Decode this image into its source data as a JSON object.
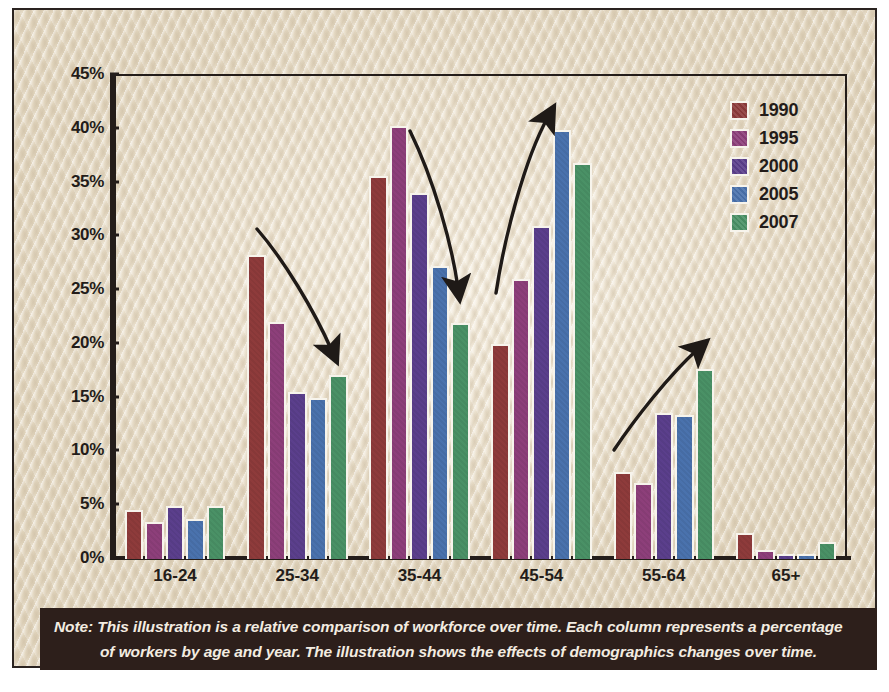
{
  "chart_data": {
    "type": "bar",
    "title": "",
    "xlabel": "",
    "ylabel": "",
    "categories": [
      "16-24",
      "25-34",
      "35-44",
      "45-54",
      "55-64",
      "65+"
    ],
    "ylim": [
      0,
      45
    ],
    "ytick_labels": [
      "0%",
      "5%",
      "10%",
      "15%",
      "20%",
      "25%",
      "30%",
      "35%",
      "40%",
      "45%"
    ],
    "ytick_values": [
      0,
      5,
      10,
      15,
      20,
      25,
      30,
      35,
      40,
      45
    ],
    "grid": false,
    "legend_position": "top-right",
    "value_unit": "%",
    "series": [
      {
        "name": "1990",
        "color": "#8e3b3b",
        "values": [
          4.6,
          28.3,
          35.6,
          20.0,
          8.1,
          2.4
        ]
      },
      {
        "name": "1995",
        "color": "#8d3f7a",
        "values": [
          3.4,
          22.0,
          40.3,
          26.0,
          7.1,
          0.8
        ]
      },
      {
        "name": "2000",
        "color": "#5b3f8c",
        "values": [
          4.9,
          15.5,
          34.0,
          31.0,
          13.6,
          0.5
        ]
      },
      {
        "name": "2005",
        "color": "#4a72ad",
        "values": [
          3.7,
          15.0,
          27.2,
          39.9,
          13.4,
          0.5
        ]
      },
      {
        "name": "2007",
        "color": "#4a9166",
        "values": [
          4.9,
          17.1,
          21.9,
          36.8,
          17.7,
          1.6
        ]
      }
    ],
    "annotations": [
      {
        "name": "trend-arrow-25-34-declining",
        "direction": "down"
      },
      {
        "name": "trend-arrow-35-44-declining",
        "direction": "down"
      },
      {
        "name": "trend-arrow-45-54-rising",
        "direction": "up"
      },
      {
        "name": "trend-arrow-55-64-rising",
        "direction": "up"
      }
    ]
  },
  "legend": {
    "items": [
      {
        "label": "1990",
        "color": "#8e3b3b"
      },
      {
        "label": "1995",
        "color": "#8d3f7a"
      },
      {
        "label": "2000",
        "color": "#5b3f8c"
      },
      {
        "label": "2005",
        "color": "#4a72ad"
      },
      {
        "label": "2007",
        "color": "#4a9166"
      }
    ]
  },
  "note": {
    "line1": "Note: This illustration is a relative comparison of workforce over time.  Each column represents a percentage",
    "line2": "of workers by age and year.  The illustration shows the effects of demographics changes over time."
  },
  "colors": {
    "panel_background": "#ece2cf",
    "frame": "#241d1a",
    "note_background": "#2d1f1b",
    "note_text": "#f3ece1",
    "bar_outline": "#f7f4ec"
  }
}
